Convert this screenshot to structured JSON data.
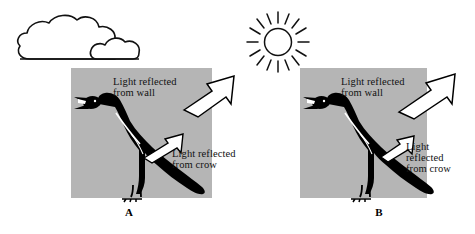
{
  "figure": {
    "background_color": "#ffffff",
    "wall_color": "#b5b5b5",
    "crow_color": "#000000",
    "arrow_fill": "#ffffff",
    "arrow_stroke": "#000000"
  },
  "panels": [
    {
      "id": "A",
      "caption": "A",
      "sky_icon": "cloud-icon",
      "wall_label": "Light reflected\nfrom wall",
      "crow_label": "Light reflected\nfrom crow",
      "crow_icon": "crow-icon",
      "wall_arrow_icon": "arrow-up-right-icon",
      "crow_arrow_icon": "arrow-up-right-icon"
    },
    {
      "id": "B",
      "caption": "B",
      "sky_icon": "sun-icon",
      "wall_label": "Light reflected\nfrom wall",
      "crow_label": "Light\nreflected\nfrom crow",
      "crow_icon": "crow-icon",
      "wall_arrow_icon": "arrow-up-right-icon",
      "crow_arrow_icon": "arrow-up-right-icon"
    }
  ]
}
